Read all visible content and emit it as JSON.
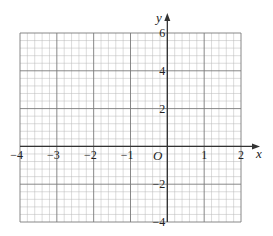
{
  "chart_data": {
    "type": "line",
    "title": "",
    "xlabel": "x",
    "ylabel": "y",
    "origin_label": "O",
    "xlim": [
      -4,
      2
    ],
    "ylim": [
      -4,
      6
    ],
    "x_ticks": [
      -4,
      -3,
      -2,
      -1,
      1,
      2
    ],
    "x_tick_labels": [
      "−4",
      "−3",
      "−2",
      "−1",
      "1",
      "2"
    ],
    "y_ticks": [
      6,
      4,
      2,
      -2,
      -4
    ],
    "y_tick_labels": [
      "6",
      "4",
      "2",
      "−2",
      "−4"
    ],
    "x_major_step": 1,
    "y_major_step": 2,
    "minor_subdivisions": 5,
    "grid": true,
    "series": []
  },
  "style": {
    "minor_grid_color": "#b8b8b8",
    "major_grid_color": "#7a7a7a",
    "axis_color": "#333333"
  }
}
